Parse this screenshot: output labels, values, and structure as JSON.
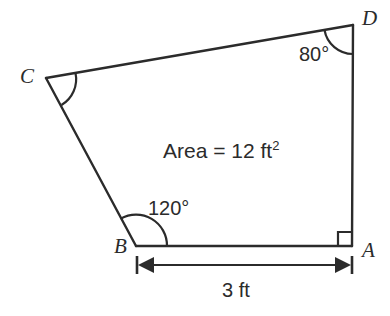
{
  "figure": {
    "kind": "quadrilateral-geometry-diagram",
    "stroke_color": "#2b2b2b",
    "text_color": "#2b2b2b",
    "background_color": "#ffffff",
    "vertices": [
      {
        "name": "A",
        "label": "A",
        "x": 352,
        "y": 246,
        "label_x": 362,
        "label_y": 240
      },
      {
        "name": "B",
        "label": "B",
        "x": 136,
        "y": 246,
        "label_x": 114,
        "label_y": 236
      },
      {
        "name": "C",
        "label": "C",
        "x": 46,
        "y": 78,
        "label_x": 20,
        "label_y": 66
      },
      {
        "name": "D",
        "label": "D",
        "x": 353,
        "y": 25,
        "label_x": 362,
        "label_y": 8
      }
    ],
    "angles": [
      {
        "at": "D",
        "label": "80°",
        "label_x": 299,
        "label_y": 44,
        "marker": "arc"
      },
      {
        "at": "C",
        "label": "",
        "marker": "arc"
      },
      {
        "at": "B",
        "label": "120°",
        "label_x": 148,
        "label_y": 198,
        "marker": "arc"
      },
      {
        "at": "A",
        "label": "",
        "marker": "right-angle-square"
      }
    ],
    "area_text": "Area = 12 ft",
    "area_exponent": "2",
    "area_label_x": 163,
    "area_label_y": 140,
    "dimension": {
      "label": "3 ft",
      "label_x": 222,
      "label_y": 280,
      "from": "B",
      "to": "A",
      "line_y": 265,
      "x_start": 137,
      "x_end": 352
    }
  }
}
